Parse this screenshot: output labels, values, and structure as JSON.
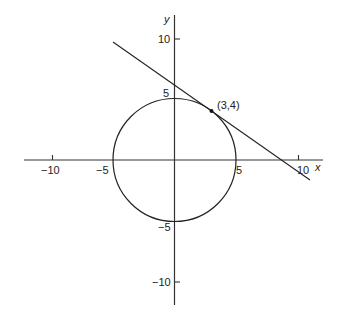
{
  "diagram": {
    "title": "",
    "axes": {
      "x_label": "x",
      "y_label": "y",
      "x_ticks": [
        {
          "value": -10,
          "label": "−10"
        },
        {
          "value": -5,
          "label": "−5"
        },
        {
          "value": 5,
          "label": "5"
        },
        {
          "value": 10,
          "label": "10"
        }
      ],
      "y_ticks": [
        {
          "value": 10,
          "label": "10"
        },
        {
          "value": 5,
          "label": "5"
        },
        {
          "value": -5,
          "label": "−5"
        },
        {
          "value": -10,
          "label": "−10"
        }
      ]
    },
    "circle": {
      "center": [
        0,
        0
      ],
      "radius": 5
    },
    "tangent_line": {
      "equation": "3x + 4y = 25"
    },
    "point": {
      "coords": [
        3,
        4
      ],
      "label": "(3,4)"
    },
    "colors": {
      "stroke": "#222222",
      "background": "#ffffff"
    }
  }
}
